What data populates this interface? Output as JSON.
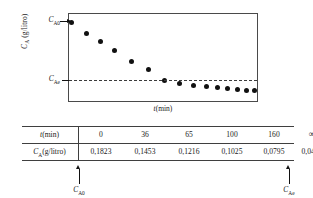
{
  "figure": {
    "plot": {
      "ylabel": "Cᴀ (g/litro)",
      "xlabel": "t(min)",
      "ytick_initial": "Cᴀ0",
      "ytick_equilibrium": "Cᴀe",
      "equilibrium_line_style": "dashed"
    },
    "table": {
      "row_headers": [
        "t(min)",
        "Cᴀ(g/litro)"
      ],
      "time_values": [
        "0",
        "36",
        "65",
        "100",
        "160",
        "∞"
      ],
      "concentration_values": [
        "0,1823",
        "0,1453",
        "0,1216",
        "0,1025",
        "0,0795",
        "0,0495"
      ]
    },
    "callouts": {
      "initial": "Cᴀ0",
      "equilibrium": "Cᴀe"
    },
    "colors": {
      "frame": "#4a4a4a",
      "point": "#111111",
      "rule": "#3f3f3f",
      "background": "#ffffff"
    }
  },
  "chart_data": {
    "type": "scatter",
    "title": "",
    "xlabel": "t(min)",
    "ylabel": "C_A (g/litro)",
    "xlim": [
      0,
      190
    ],
    "ylim": [
      0.04,
      0.19
    ],
    "grid": false,
    "legend": null,
    "annotations": [
      {
        "text": "C_A0",
        "target": "y = 0,1823",
        "position": "left-axis"
      },
      {
        "text": "C_Ae",
        "target": "y = 0,0495",
        "position": "left-axis"
      },
      {
        "text": "equilibrium dashed line",
        "y": 0.0495
      }
    ],
    "series": [
      {
        "name": "C_A vs t",
        "x": [
          0,
          9,
          18,
          28,
          42,
          58,
          75,
          90,
          104,
          118,
          132,
          145,
          158,
          172,
          182
        ],
        "y": [
          0.1823,
          0.169,
          0.1575,
          0.1453,
          0.131,
          0.1216,
          0.1025,
          0.088,
          0.0795,
          0.07,
          0.064,
          0.06,
          0.057,
          0.053,
          0.052
        ]
      }
    ],
    "table": {
      "columns": [
        "0",
        "36",
        "65",
        "100",
        "160",
        "∞"
      ],
      "rows": [
        {
          "label": "t(min)",
          "values": [
            "0",
            "36",
            "65",
            "100",
            "160",
            "∞"
          ]
        },
        {
          "label": "C_A(g/litro)",
          "values": [
            "0,1823",
            "0,1453",
            "0,1216",
            "0,1025",
            "0,0795",
            "0,0495"
          ]
        }
      ]
    }
  },
  "_point_px": [
    {
      "l": 2,
      "t": 8
    },
    {
      "l": 17,
      "t": 19
    },
    {
      "l": 31,
      "t": 27
    },
    {
      "l": 45,
      "t": 36
    },
    {
      "l": 62,
      "t": 47
    },
    {
      "l": 79,
      "t": 55
    },
    {
      "l": 95,
      "t": 66
    },
    {
      "l": 110,
      "t": 69
    },
    {
      "l": 124,
      "t": 71
    },
    {
      "l": 137,
      "t": 72
    },
    {
      "l": 148,
      "t": 73
    },
    {
      "l": 158,
      "t": 74
    },
    {
      "l": 168,
      "t": 75
    },
    {
      "l": 177,
      "t": 76
    },
    {
      "l": 185,
      "t": 76
    }
  ]
}
